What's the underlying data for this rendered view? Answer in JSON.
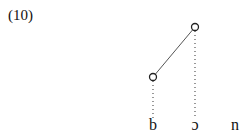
{
  "example": {
    "number": "(10)"
  },
  "diagram": {
    "nodes": [
      {
        "id": "high",
        "x": 195,
        "y": 27
      },
      {
        "id": "low",
        "x": 153,
        "y": 77
      }
    ],
    "association_line": {
      "from": "low",
      "to": "high"
    },
    "dotted_links": [
      {
        "from_node": "low",
        "to_segment": "b"
      },
      {
        "from_node": "high",
        "to_segment": "ɔ"
      }
    ],
    "segments": [
      {
        "label": "b",
        "x": 153
      },
      {
        "label": "ɔ",
        "x": 195
      },
      {
        "label": "n",
        "x": 235
      }
    ]
  }
}
